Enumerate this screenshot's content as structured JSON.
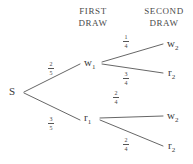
{
  "headers": {
    "first_draw": "FIRST\nDRAW",
    "first_draw_line1": "FIRST",
    "first_draw_line2": "DRAW",
    "second_draw_line1": "SECOND",
    "second_draw_line2": "DRAW"
  },
  "nodes": {
    "root": {
      "label": "S",
      "base": "S",
      "sub": ""
    },
    "first": [
      {
        "label": "w1",
        "base": "w",
        "sub": "1"
      },
      {
        "label": "r1",
        "base": "r",
        "sub": "1"
      }
    ],
    "second": [
      {
        "label": "w2",
        "base": "w",
        "sub": "2"
      },
      {
        "label": "r2",
        "base": "r",
        "sub": "2"
      },
      {
        "label": "w2",
        "base": "w",
        "sub": "2"
      },
      {
        "label": "r2",
        "base": "r",
        "sub": "2"
      }
    ]
  },
  "probabilities": {
    "s_to_w1": {
      "numerator": "2",
      "denominator": "5",
      "text": "2/5"
    },
    "s_to_r1": {
      "numerator": "3",
      "denominator": "5",
      "text": "3/5"
    },
    "w1_to_w2": {
      "numerator": "1",
      "denominator": "4",
      "text": "1/4"
    },
    "w1_to_r2": {
      "numerator": "3",
      "denominator": "4",
      "text": "3/4"
    },
    "r1_to_w2": {
      "numerator": "2",
      "denominator": "4",
      "text": "2/4"
    },
    "r1_to_r2": {
      "numerator": "2",
      "denominator": "4",
      "text": "2/4"
    }
  },
  "style": {
    "line_color": "#555555",
    "text_color": "#3a3a3a",
    "background": "#ffffff"
  }
}
